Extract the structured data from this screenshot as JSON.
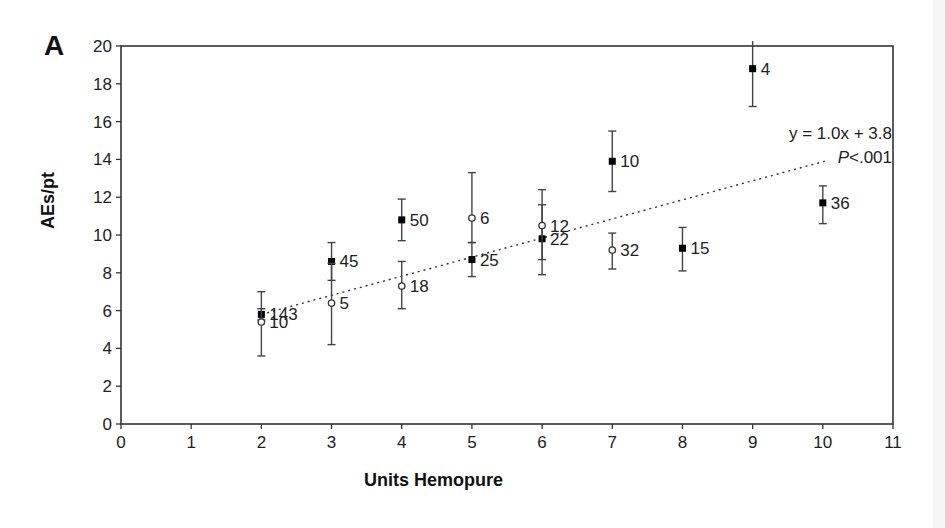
{
  "panel_label": "A",
  "chart_data": {
    "type": "scatter",
    "title": "",
    "xlabel": "Units Hemopure",
    "ylabel": "AEs/pt",
    "xlim": [
      0,
      11
    ],
    "ylim": [
      0,
      20
    ],
    "x_ticks": [
      0,
      1,
      2,
      3,
      4,
      5,
      6,
      7,
      8,
      9,
      10,
      11
    ],
    "y_ticks": [
      0,
      2,
      4,
      6,
      8,
      10,
      12,
      14,
      16,
      18,
      20
    ],
    "grid": false,
    "legend": null,
    "series": [
      {
        "name": "filled-squares",
        "marker": "filled-square",
        "points": [
          {
            "x": 2,
            "y": 5.8,
            "err_low": 5.5,
            "err_high": 6.1,
            "n_label": "143"
          },
          {
            "x": 3,
            "y": 8.6,
            "err_low": 7.6,
            "err_high": 9.6,
            "n_label": "45"
          },
          {
            "x": 4,
            "y": 10.8,
            "err_low": 9.7,
            "err_high": 11.9,
            "n_label": "50"
          },
          {
            "x": 5,
            "y": 8.7,
            "err_low": 7.8,
            "err_high": 9.6,
            "n_label": "25"
          },
          {
            "x": 6,
            "y": 9.8,
            "err_low": 7.9,
            "err_high": 11.6,
            "n_label": "22"
          },
          {
            "x": 7,
            "y": 13.9,
            "err_low": 12.3,
            "err_high": 15.5,
            "n_label": "10"
          },
          {
            "x": 8,
            "y": 9.3,
            "err_low": 8.1,
            "err_high": 10.4,
            "n_label": "15"
          },
          {
            "x": 9,
            "y": 18.8,
            "err_low": 16.8,
            "err_high": 20.8,
            "n_label": "4"
          },
          {
            "x": 10,
            "y": 11.7,
            "err_low": 10.6,
            "err_high": 12.6,
            "n_label": "36"
          }
        ]
      },
      {
        "name": "open-circles",
        "marker": "open-circle",
        "points": [
          {
            "x": 2,
            "y": 5.4,
            "err_low": 3.6,
            "err_high": 7.0,
            "n_label": "10"
          },
          {
            "x": 3,
            "y": 6.4,
            "err_low": 4.2,
            "err_high": 8.5,
            "n_label": "5"
          },
          {
            "x": 4,
            "y": 7.3,
            "err_low": 6.1,
            "err_high": 8.6,
            "n_label": "18"
          },
          {
            "x": 5,
            "y": 10.9,
            "err_low": 9.6,
            "err_high": 13.3,
            "n_label": "6"
          },
          {
            "x": 6,
            "y": 10.5,
            "err_low": 8.7,
            "err_high": 12.4,
            "n_label": "12"
          },
          {
            "x": 7,
            "y": 9.2,
            "err_low": 8.2,
            "err_high": 10.1,
            "n_label": "32"
          }
        ]
      }
    ],
    "trendline": {
      "style": "dotted",
      "slope": 1.0,
      "intercept": 3.8,
      "x_range": [
        2,
        10
      ],
      "equation_label": "y = 1.0x + 3.8",
      "p_label_italic": "P",
      "p_label_rest": "<.001"
    }
  }
}
